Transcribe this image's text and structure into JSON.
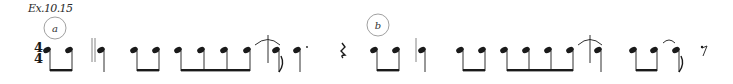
{
  "example_label": "Ex.10.15",
  "sections": [
    {
      "id": "a",
      "marker": "a"
    },
    {
      "id": "b",
      "marker": "b"
    }
  ],
  "time_signature": {
    "numerator": "4",
    "denominator": "4"
  },
  "colors": {
    "ink": "#1a1a1a",
    "circle": "#888888"
  }
}
